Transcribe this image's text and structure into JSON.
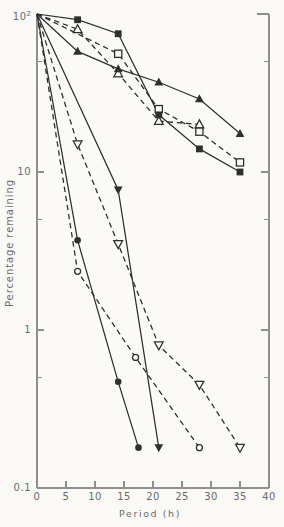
{
  "figure": {
    "background": "#fbfaf6",
    "axis_color": "#8f8f8f",
    "data_color": "#2f2f2f",
    "text_color": "#6b6b6b"
  },
  "chart_data": {
    "type": "line",
    "title": "",
    "xlabel": "Period (h)",
    "ylabel": "Percentage remaining",
    "xlim": [
      0,
      40
    ],
    "x_ticks": [
      0,
      5,
      10,
      15,
      20,
      25,
      30,
      35,
      40
    ],
    "y_scale": "log",
    "ylim": [
      0.1,
      100
    ],
    "y_tick_labels": [
      {
        "value": 100,
        "base": "10",
        "sup": "2"
      },
      {
        "value": 10,
        "base": "10",
        "sup": ""
      },
      {
        "value": 1,
        "base": "1",
        "sup": ""
      },
      {
        "value": 0.1,
        "base": "0.1",
        "sup": ""
      }
    ],
    "y_major_ticks": [
      10,
      1
    ],
    "y_minor_ticks": [
      50,
      5,
      0.5
    ],
    "grid": false,
    "legend": false,
    "series": [
      {
        "name": "filled-square-solid",
        "marker": "square-filled",
        "line": "solid",
        "points": [
          [
            0,
            100
          ],
          [
            7,
            92
          ],
          [
            14,
            75
          ],
          [
            21,
            23
          ],
          [
            28,
            14
          ],
          [
            35,
            10
          ]
        ]
      },
      {
        "name": "open-square-dashed",
        "marker": "square-open",
        "line": "dashed",
        "points": [
          [
            0,
            100
          ],
          [
            14,
            56
          ],
          [
            21,
            25
          ],
          [
            28,
            18
          ],
          [
            35,
            11.5
          ]
        ]
      },
      {
        "name": "filled-triangle-solid",
        "marker": "triangle-up-filled",
        "line": "solid",
        "points": [
          [
            0,
            100
          ],
          [
            7,
            58
          ],
          [
            14,
            45
          ],
          [
            21,
            37
          ],
          [
            28,
            29
          ],
          [
            35,
            17.5
          ]
        ]
      },
      {
        "name": "open-triangle-dashed",
        "marker": "triangle-up-open",
        "line": "dashed",
        "points": [
          [
            0,
            100
          ],
          [
            7,
            80
          ],
          [
            14,
            42
          ],
          [
            21,
            21
          ],
          [
            28,
            20
          ]
        ]
      },
      {
        "name": "open-inverted-triangle-dashed",
        "marker": "triangle-down-open",
        "line": "dashed",
        "points": [
          [
            0,
            100
          ],
          [
            7,
            15
          ],
          [
            14,
            3.5
          ],
          [
            21,
            0.8
          ],
          [
            28,
            0.45
          ],
          [
            35,
            0.18
          ]
        ]
      },
      {
        "name": "filled-inverted-triangle-solid",
        "marker": "triangle-down-filled",
        "line": "solid",
        "points": [
          [
            0,
            100
          ],
          [
            14,
            7.7
          ],
          [
            21,
            0.18
          ]
        ]
      },
      {
        "name": "filled-circle-solid",
        "marker": "circle-filled",
        "line": "solid",
        "points": [
          [
            0,
            100
          ],
          [
            7,
            3.7
          ],
          [
            14,
            0.47
          ],
          [
            17.5,
            0.18
          ]
        ]
      },
      {
        "name": "open-circle-dashed",
        "marker": "circle-open",
        "line": "dashed",
        "points": [
          [
            0,
            100
          ],
          [
            7,
            2.35
          ],
          [
            17,
            0.67
          ],
          [
            28,
            0.18
          ]
        ]
      }
    ]
  }
}
